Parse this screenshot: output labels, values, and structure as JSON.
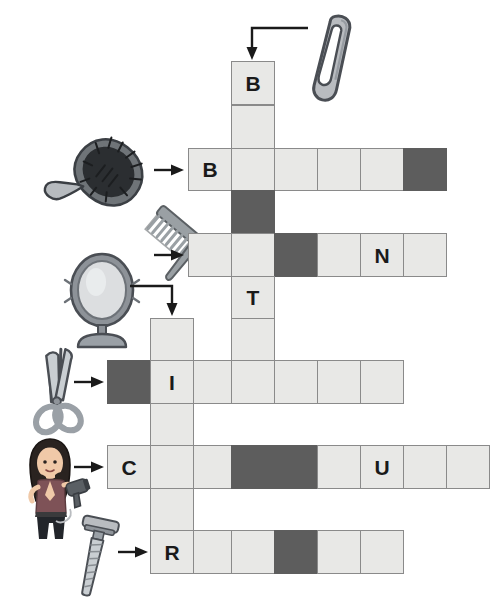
{
  "puzzle": {
    "title": "Hair Tools Picture Crossword",
    "cell_size": 43,
    "colors": {
      "cell_fill": "#e8e8e6",
      "cell_border": "#8a8a8a",
      "block_fill": "#5d5d5d",
      "letter": "#1a1a1a",
      "arrow": "#1a1a1a",
      "background": "#ffffff"
    },
    "entries": [
      {
        "id": "entry-hairclip",
        "clue_icon": "hair-clip-icon",
        "direction": "down",
        "length": 6,
        "given_letters": {
          "0": "B"
        }
      },
      {
        "id": "entry-hairbrush",
        "clue_icon": "hair-brush-icon",
        "direction": "across",
        "length": 6,
        "given_letters": {
          "0": "B"
        }
      },
      {
        "id": "entry-comb",
        "clue_icon": "comb-icon",
        "direction": "across",
        "length": 6,
        "given_letters": {
          "4": "N"
        }
      },
      {
        "id": "entry-mirror",
        "clue_icon": "hand-mirror-icon",
        "direction": "down",
        "length": 6,
        "given_letters": {
          "1": "I"
        }
      },
      {
        "id": "entry-scissors",
        "clue_icon": "scissors-icon",
        "direction": "across",
        "length": 7,
        "given_letters": {
          "1": "I"
        }
      },
      {
        "id": "entry-hairdryer",
        "clue_icon": "hair-dryer-icon",
        "direction": "across",
        "length": 9,
        "given_letters": {
          "0": "C",
          "6": "U"
        }
      },
      {
        "id": "entry-razor",
        "clue_icon": "razor-icon",
        "direction": "across",
        "length": 6,
        "given_letters": {
          "0": "R"
        }
      }
    ],
    "cells": [
      {
        "name": "cell-r0c3",
        "x": 231,
        "y": 61,
        "w": 44,
        "h": 44,
        "block": false,
        "letter": "B"
      },
      {
        "name": "cell-r1c3",
        "x": 231,
        "y": 105,
        "w": 44,
        "h": 44,
        "block": false,
        "letter": ""
      },
      {
        "name": "cell-r2c2a",
        "x": 188,
        "y": 148,
        "w": 44,
        "h": 43,
        "block": false,
        "letter": "B"
      },
      {
        "name": "cell-r2c3",
        "x": 231,
        "y": 148,
        "w": 44,
        "h": 43,
        "block": false,
        "letter": ""
      },
      {
        "name": "cell-r2c4",
        "x": 274,
        "y": 148,
        "w": 44,
        "h": 43,
        "block": false,
        "letter": ""
      },
      {
        "name": "cell-r2c5",
        "x": 317,
        "y": 148,
        "w": 44,
        "h": 43,
        "block": false,
        "letter": ""
      },
      {
        "name": "cell-r2c6",
        "x": 360,
        "y": 148,
        "w": 44,
        "h": 43,
        "block": false,
        "letter": ""
      },
      {
        "name": "cell-r2c7",
        "x": 403,
        "y": 148,
        "w": 44,
        "h": 43,
        "block": true,
        "letter": ""
      },
      {
        "name": "cell-r3c3",
        "x": 231,
        "y": 190,
        "w": 44,
        "h": 44,
        "block": true,
        "letter": ""
      },
      {
        "name": "cell-r4c2a",
        "x": 188,
        "y": 233,
        "w": 44,
        "h": 44,
        "block": false,
        "letter": ""
      },
      {
        "name": "cell-r4c3",
        "x": 231,
        "y": 233,
        "w": 44,
        "h": 44,
        "block": false,
        "letter": ""
      },
      {
        "name": "cell-r4c4",
        "x": 274,
        "y": 233,
        "w": 44,
        "h": 44,
        "block": true,
        "letter": ""
      },
      {
        "name": "cell-r4c5",
        "x": 317,
        "y": 233,
        "w": 44,
        "h": 44,
        "block": false,
        "letter": ""
      },
      {
        "name": "cell-r4c6",
        "x": 360,
        "y": 233,
        "w": 44,
        "h": 44,
        "block": false,
        "letter": "N"
      },
      {
        "name": "cell-r4c7",
        "x": 403,
        "y": 233,
        "w": 44,
        "h": 44,
        "block": false,
        "letter": ""
      },
      {
        "name": "cell-r5c3",
        "x": 231,
        "y": 276,
        "w": 44,
        "h": 43,
        "block": false,
        "letter": "T"
      },
      {
        "name": "cell-r6c3",
        "x": 231,
        "y": 318,
        "w": 44,
        "h": 43,
        "block": false,
        "letter": ""
      },
      {
        "name": "cell-r6c1",
        "x": 150,
        "y": 318,
        "w": 44,
        "h": 43,
        "block": false,
        "letter": ""
      },
      {
        "name": "cell-r7c0",
        "x": 107,
        "y": 360,
        "w": 44,
        "h": 44,
        "block": true,
        "letter": ""
      },
      {
        "name": "cell-r7c1",
        "x": 150,
        "y": 360,
        "w": 44,
        "h": 44,
        "block": false,
        "letter": "I"
      },
      {
        "name": "cell-r7c2",
        "x": 193,
        "y": 360,
        "w": 44,
        "h": 44,
        "block": false,
        "letter": ""
      },
      {
        "name": "cell-r7c3",
        "x": 231,
        "y": 360,
        "w": 44,
        "h": 44,
        "block": false,
        "letter": ""
      },
      {
        "name": "cell-r7c4",
        "x": 274,
        "y": 360,
        "w": 44,
        "h": 44,
        "block": false,
        "letter": ""
      },
      {
        "name": "cell-r7c5",
        "x": 317,
        "y": 360,
        "w": 44,
        "h": 44,
        "block": false,
        "letter": ""
      },
      {
        "name": "cell-r7c6",
        "x": 360,
        "y": 360,
        "w": 44,
        "h": 44,
        "block": false,
        "letter": ""
      },
      {
        "name": "cell-r8c1",
        "x": 150,
        "y": 403,
        "w": 44,
        "h": 43,
        "block": false,
        "letter": ""
      },
      {
        "name": "cell-r9c0",
        "x": 107,
        "y": 445,
        "w": 44,
        "h": 44,
        "block": false,
        "letter": "C"
      },
      {
        "name": "cell-r9c1",
        "x": 150,
        "y": 445,
        "w": 44,
        "h": 44,
        "block": false,
        "letter": ""
      },
      {
        "name": "cell-r9c2",
        "x": 193,
        "y": 445,
        "w": 44,
        "h": 44,
        "block": false,
        "letter": ""
      },
      {
        "name": "cell-r9c3",
        "x": 231,
        "y": 445,
        "w": 44,
        "h": 44,
        "block": true,
        "letter": ""
      },
      {
        "name": "cell-r9c4",
        "x": 274,
        "y": 445,
        "w": 44,
        "h": 44,
        "block": true,
        "letter": ""
      },
      {
        "name": "cell-r9c5",
        "x": 317,
        "y": 445,
        "w": 44,
        "h": 44,
        "block": false,
        "letter": ""
      },
      {
        "name": "cell-r9c6",
        "x": 360,
        "y": 445,
        "w": 44,
        "h": 44,
        "block": false,
        "letter": "U"
      },
      {
        "name": "cell-r9c7",
        "x": 403,
        "y": 445,
        "w": 44,
        "h": 44,
        "block": false,
        "letter": ""
      },
      {
        "name": "cell-r9c8",
        "x": 446,
        "y": 445,
        "w": 44,
        "h": 44,
        "block": false,
        "letter": ""
      },
      {
        "name": "cell-r10c1",
        "x": 150,
        "y": 488,
        "w": 44,
        "h": 43,
        "block": false,
        "letter": ""
      },
      {
        "name": "cell-r11c1",
        "x": 150,
        "y": 530,
        "w": 44,
        "h": 44,
        "block": false,
        "letter": "R"
      },
      {
        "name": "cell-r11c2",
        "x": 193,
        "y": 530,
        "w": 44,
        "h": 44,
        "block": false,
        "letter": ""
      },
      {
        "name": "cell-r11c3",
        "x": 231,
        "y": 530,
        "w": 44,
        "h": 44,
        "block": false,
        "letter": ""
      },
      {
        "name": "cell-r11c4",
        "x": 274,
        "y": 530,
        "w": 44,
        "h": 44,
        "block": true,
        "letter": ""
      },
      {
        "name": "cell-r11c5",
        "x": 317,
        "y": 530,
        "w": 44,
        "h": 44,
        "block": false,
        "letter": ""
      },
      {
        "name": "cell-r11c6",
        "x": 360,
        "y": 530,
        "w": 44,
        "h": 44,
        "block": false,
        "letter": ""
      }
    ]
  }
}
